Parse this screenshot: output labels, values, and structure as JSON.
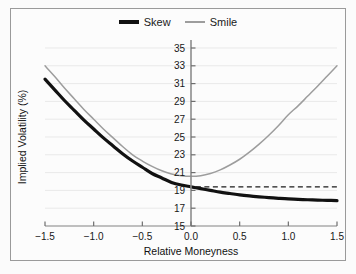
{
  "chart_data": {
    "type": "line",
    "title": "",
    "xlabel": "Relative Moneyness",
    "ylabel": "Implied Volatility (%)",
    "xlim": [
      -1.5,
      1.5
    ],
    "ylim": [
      15,
      35
    ],
    "xticks": [
      "-1.5",
      "-1.0",
      "-0.5",
      "0.0",
      "0.5",
      "1.0",
      "1.5"
    ],
    "xtick_values": [
      -1.5,
      -1.0,
      -0.5,
      0.0,
      0.5,
      1.0,
      1.5
    ],
    "yticks": [
      "15",
      "17",
      "19",
      "21",
      "23",
      "25",
      "27",
      "29",
      "31",
      "33",
      "35"
    ],
    "ytick_values": [
      15,
      17,
      19,
      21,
      23,
      25,
      27,
      29,
      31,
      33,
      35
    ],
    "grid": true,
    "legend_position": "top-center",
    "x": [
      -1.5,
      -1.4,
      -1.3,
      -1.2,
      -1.1,
      -1.0,
      -0.9,
      -0.8,
      -0.7,
      -0.6,
      -0.5,
      -0.4,
      -0.3,
      -0.2,
      -0.1,
      0.0,
      0.1,
      0.2,
      0.3,
      0.4,
      0.5,
      0.6,
      0.7,
      0.8,
      0.9,
      1.0,
      1.1,
      1.2,
      1.3,
      1.4,
      1.5
    ],
    "series": [
      {
        "name": "Skew",
        "color": "#111111",
        "width": 3.2,
        "style": "solid",
        "values": [
          31.5,
          30.3,
          29.1,
          28.0,
          26.9,
          25.9,
          24.9,
          24.0,
          23.1,
          22.3,
          21.6,
          20.9,
          20.4,
          19.9,
          19.6,
          19.4,
          19.2,
          19.0,
          18.8,
          18.65,
          18.5,
          18.38,
          18.28,
          18.19,
          18.11,
          18.04,
          17.99,
          17.95,
          17.91,
          17.88,
          17.85
        ]
      },
      {
        "name": "Smile",
        "color": "#9d9d9d",
        "width": 1.5,
        "style": "solid",
        "values": [
          33.0,
          31.8,
          30.5,
          29.3,
          28.1,
          27.0,
          25.9,
          24.9,
          23.9,
          23.0,
          22.3,
          21.7,
          21.2,
          20.85,
          20.65,
          20.58,
          20.65,
          20.9,
          21.3,
          21.85,
          22.5,
          23.3,
          24.2,
          25.2,
          26.3,
          27.5,
          28.5,
          29.6,
          30.7,
          31.85,
          33.0
        ]
      }
    ],
    "annotations": [
      {
        "name": "reference-level",
        "type": "dashed-horizontal-line",
        "y": 19.4,
        "x_start": 0.05,
        "x_end": 1.5,
        "color": "#1a1a1a"
      }
    ]
  },
  "legend": {
    "items": [
      {
        "label": "Skew",
        "swatch": "thick-black-line"
      },
      {
        "label": "Smile",
        "swatch": "thin-gray-line"
      }
    ]
  }
}
